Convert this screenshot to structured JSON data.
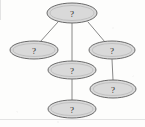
{
  "diagram": {
    "background_color": "#fdfdfc",
    "node_fill_color": "#d9d9d9",
    "node_border_color": "#6b6b6b",
    "edge_color": "#7a7a7a",
    "text_color": "#2a2a2a",
    "node_label": "?",
    "node_count": 6,
    "edge_count": 5,
    "nodes": [
      {
        "id": "top",
        "label": "?",
        "cx": 72,
        "cy": 13,
        "rx": 25,
        "ry": 10
      },
      {
        "id": "left",
        "label": "?",
        "cx": 34,
        "cy": 50,
        "rx": 24,
        "ry": 9
      },
      {
        "id": "right",
        "label": "?",
        "cx": 112,
        "cy": 50,
        "rx": 23,
        "ry": 9
      },
      {
        "id": "middle",
        "label": "?",
        "cx": 72,
        "cy": 70,
        "rx": 24,
        "ry": 9
      },
      {
        "id": "lower-right",
        "label": "?",
        "cx": 113,
        "cy": 89,
        "rx": 23,
        "ry": 9
      },
      {
        "id": "bottom",
        "label": "?",
        "cx": 72,
        "cy": 109,
        "rx": 24,
        "ry": 9
      }
    ],
    "edges": [
      {
        "id": "top-left",
        "from": "top",
        "to": "left",
        "x1": 58,
        "y1": 22,
        "x2": 40,
        "y2": 42
      },
      {
        "id": "top-middle",
        "from": "top",
        "to": "middle",
        "x1": 72,
        "y1": 23,
        "x2": 72,
        "y2": 61
      },
      {
        "id": "top-right",
        "from": "top",
        "to": "right",
        "x1": 88,
        "y1": 22,
        "x2": 105,
        "y2": 42
      },
      {
        "id": "right-lowerright",
        "from": "right",
        "to": "lower-right",
        "x1": 112,
        "y1": 59,
        "x2": 113,
        "y2": 80
      },
      {
        "id": "middle-bottom",
        "from": "middle",
        "to": "bottom",
        "x1": 72,
        "y1": 79,
        "x2": 72,
        "y2": 100
      }
    ]
  }
}
